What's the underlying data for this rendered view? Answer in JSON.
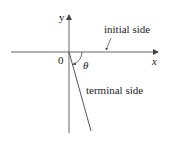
{
  "diagram": {
    "type": "angle-in-standard-position",
    "axes": {
      "x_label": "x",
      "y_label": "y",
      "origin_label": "0"
    },
    "angle_label": "θ",
    "annotations": {
      "initial_side": "initial side",
      "terminal_side": "terminal side"
    },
    "colors": {
      "line": "#444444",
      "text": "#222222"
    }
  }
}
